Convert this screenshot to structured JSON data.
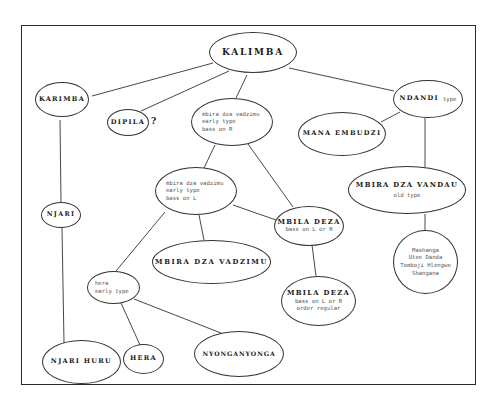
{
  "diagram": {
    "type": "tree-diagram",
    "nodes": {
      "kalimba": {
        "title": "KALIMBA"
      },
      "karimba": {
        "title": "KARIMBA"
      },
      "dipila": {
        "title": "DIPILA",
        "suffix": "?"
      },
      "mbira_r": {
        "lines": [
          "mbira dza vadzimu",
          "early type",
          "bass on R"
        ]
      },
      "ndandi": {
        "title": "NDANDI",
        "subtitle": "type"
      },
      "mana_embudzi": {
        "title": "MANA EMBUDZI"
      },
      "mbira_l": {
        "lines": [
          "mbira dza vadzimu",
          "early type",
          "bass on L"
        ]
      },
      "njari": {
        "title": "NJARI"
      },
      "mbila_deza_1": {
        "title": "MBILA DEZA",
        "lines": [
          "bass on L or R"
        ]
      },
      "mbira_dza_vandau": {
        "title": "MBIRA DZA VANDAU",
        "lines": [
          "old type"
        ]
      },
      "vandau_group": {
        "lines": [
          "Mashanga",
          "Utee Danda",
          "Tomboji Hlengwe",
          "Shangana"
        ]
      },
      "mbira_dza_vadzimu": {
        "title": "MBIRA DZA VADZIMU"
      },
      "hera_early": {
        "lines": [
          "hera",
          "early type"
        ]
      },
      "mbila_deza_2": {
        "title": "MBILA DEZA",
        "lines": [
          "bass on L or R",
          "order regular"
        ]
      },
      "njari_huru": {
        "title": "NJARI HURU"
      },
      "hera": {
        "title": "HERA"
      },
      "nyonganyonga": {
        "title": "NYONGANYONGA"
      }
    },
    "edges": [
      [
        "kalimba",
        "karimba"
      ],
      [
        "kalimba",
        "dipila"
      ],
      [
        "kalimba",
        "mbira_r"
      ],
      [
        "kalimba",
        "ndandi"
      ],
      [
        "ndandi",
        "mana_embudzi"
      ],
      [
        "ndandi",
        "mbira_dza_vandau"
      ],
      [
        "mbira_dza_vandau",
        "vandau_group"
      ],
      [
        "karimba",
        "njari"
      ],
      [
        "njari",
        "njari_huru"
      ],
      [
        "mbira_r",
        "mbira_l"
      ],
      [
        "mbira_r",
        "mbila_deza_1"
      ],
      [
        "mbira_l",
        "mbila_deza_1"
      ],
      [
        "mbira_l",
        "mbira_dza_vadzimu"
      ],
      [
        "mbira_l",
        "hera_early"
      ],
      [
        "mbila_deza_1",
        "mbila_deza_2"
      ],
      [
        "hera_early",
        "hera"
      ],
      [
        "hera_early",
        "nyonganyonga"
      ]
    ]
  }
}
